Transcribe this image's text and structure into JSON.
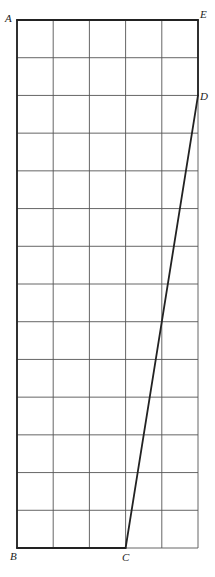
{
  "diagram": {
    "grid": {
      "columns": 5,
      "rows": 14
    },
    "points": {
      "A": {
        "label": "A",
        "grid": [
          0,
          14
        ]
      },
      "B": {
        "label": "B",
        "grid": [
          0,
          0
        ]
      },
      "C": {
        "label": "C",
        "grid": [
          3,
          0
        ]
      },
      "D": {
        "label": "D",
        "grid": [
          5,
          12
        ]
      },
      "E": {
        "label": "E",
        "grid": [
          5,
          14
        ]
      }
    },
    "bold_segments": [
      "AE",
      "AB",
      "BC",
      "CD",
      "DE"
    ],
    "colors": {
      "line": "#222222",
      "grid": "#555555",
      "background": "#ffffff"
    }
  }
}
